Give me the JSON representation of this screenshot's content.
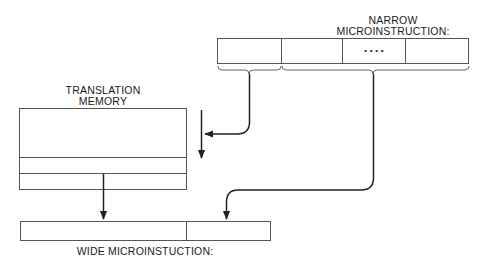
{
  "diagram": {
    "narrow": {
      "title_line1": "NARROW",
      "title_line2": "MICROINSTRUCTION:",
      "fields": [
        "",
        "",
        "• • • •",
        ""
      ]
    },
    "translation_memory": {
      "title_line1": "TRANSLATION",
      "title_line2": "MEMORY",
      "rows": 3
    },
    "wide": {
      "title": "WIDE MICROINSTUCTION:",
      "fields": [
        "",
        ""
      ]
    },
    "arrows": [
      {
        "from": "narrow-field-1",
        "to": "translation-memory-address",
        "shape": "curved"
      },
      {
        "from": "translation-memory-address",
        "to": "translation-memory",
        "shape": "straight-down"
      },
      {
        "from": "translation-memory-row-3",
        "to": "wide-field-1",
        "shape": "straight-down"
      },
      {
        "from": "narrow-fields-2-4",
        "to": "wide-field-2",
        "shape": "curved"
      }
    ],
    "colors": {
      "line": "#222222",
      "background": "#ffffff"
    }
  }
}
